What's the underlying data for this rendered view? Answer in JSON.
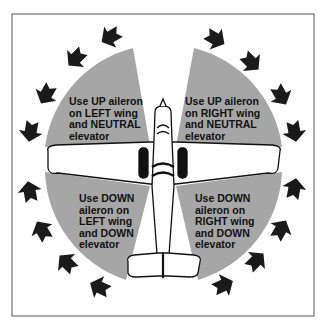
{
  "diagram": {
    "type": "crosswind-taxi-control-diagram",
    "colors": {
      "quadrant_fill": "#a6a6a6",
      "arrow_fill": "#1a1a1a",
      "frame": "#555555",
      "airplane_fill": "#ffffff",
      "airplane_stroke": "#111111"
    },
    "quadrants": [
      {
        "position": "top-left",
        "lines": [
          "Use UP aileron",
          "on LEFT wing",
          "and NEUTRAL",
          "elevator"
        ]
      },
      {
        "position": "top-right",
        "lines": [
          "Use UP aileron",
          "on RIGHT wing",
          "and NEUTRAL",
          "elevator"
        ]
      },
      {
        "position": "bottom-left",
        "lines": [
          "Use DOWN",
          "aileron on",
          "LEFT wing",
          "and DOWN",
          "elevator"
        ]
      },
      {
        "position": "bottom-right",
        "lines": [
          "Use DOWN",
          "aileron on",
          "RIGHT wing",
          "and DOWN",
          "elevator"
        ]
      }
    ],
    "wind_arrows": {
      "count": 16,
      "icon": "wind-arrow-icon",
      "direction": "pointing-inward-toward-airplane"
    },
    "airplane": {
      "icon": "airplane-top-view-icon"
    }
  }
}
